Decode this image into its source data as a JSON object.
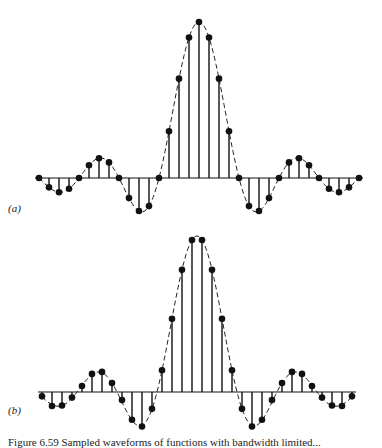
{
  "figure": {
    "panels": [
      {
        "label": "(a)",
        "label_pos": [
          8,
          202
        ]
      },
      {
        "label": "(b)",
        "label_pos": [
          8,
          404
        ]
      }
    ],
    "caption": "Figure 6.59 Sampled waveforms of functions with bandwidth limited..."
  },
  "chart_data": [
    {
      "type": "stem",
      "panel": "(a)",
      "title": "",
      "xlabel": "",
      "ylabel": "",
      "grid": false,
      "envelope": "sinc (dashed)",
      "sample_spacing_px": 10,
      "center_px": [
        199,
        178
      ],
      "amplitude_px": 156,
      "x": [
        -16,
        -15,
        -14,
        -13,
        -12,
        -11,
        -10,
        -9,
        -8,
        -7,
        -6,
        -5,
        -4,
        -3,
        -2,
        -1,
        0,
        1,
        2,
        3,
        4,
        5,
        6,
        7,
        8,
        9,
        10,
        11,
        12,
        13,
        14,
        15,
        16
      ],
      "values": [
        0,
        -0.06,
        -0.091,
        -0.069,
        0,
        0.082,
        0.127,
        0.1,
        0,
        -0.129,
        -0.212,
        -0.18,
        0,
        0.3,
        0.637,
        0.9,
        1.0,
        0.9,
        0.637,
        0.3,
        0,
        -0.18,
        -0.212,
        -0.129,
        0,
        0.1,
        0.127,
        0.082,
        0,
        -0.069,
        -0.091,
        -0.06,
        0
      ],
      "ylim": [
        -0.25,
        1.0
      ]
    },
    {
      "type": "stem",
      "panel": "(b)",
      "title": "",
      "xlabel": "",
      "ylabel": "",
      "grid": false,
      "envelope": "sinc (dashed)",
      "sample_spacing_px": 10,
      "center_px": [
        197,
        392
      ],
      "amplitude_px": 156,
      "x": [
        -15.5,
        -14.5,
        -13.5,
        -12.5,
        -11.5,
        -10.5,
        -9.5,
        -8.5,
        -7.5,
        -6.5,
        -5.5,
        -4.5,
        -3.5,
        -2.5,
        -1.5,
        -0.5,
        0.5,
        1.5,
        2.5,
        3.5,
        4.5,
        5.5,
        6.5,
        7.5,
        8.5,
        9.5,
        10.5,
        11.5,
        12.5,
        13.5,
        14.5,
        15.5
      ],
      "values": [
        -0.028,
        -0.09,
        -0.087,
        -0.036,
        0.038,
        0.116,
        0.129,
        0.058,
        -0.052,
        -0.178,
        -0.221,
        -0.108,
        0.139,
        0.47,
        0.784,
        0.974,
        0.974,
        0.784,
        0.47,
        0.139,
        -0.108,
        -0.221,
        -0.178,
        -0.052,
        0.058,
        0.129,
        0.116,
        0.038,
        -0.036,
        -0.087,
        -0.09,
        -0.028
      ],
      "ylim": [
        -0.25,
        1.0
      ]
    }
  ]
}
